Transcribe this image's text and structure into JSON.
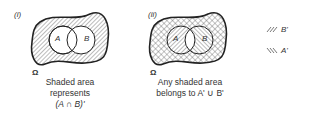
{
  "diagram_i": {
    "label": "(i)",
    "set_a": "A",
    "set_b": "B",
    "universe": "Ω",
    "caption_line1": "Shaded area",
    "caption_line2": "represents",
    "caption_line3": "(A ∩ B)'"
  },
  "diagram_ii": {
    "label": "(ii)",
    "set_a": "A",
    "set_b": "B",
    "universe": "Ω",
    "caption_line1": "Any shaded area",
    "caption_line2": "belongs to A' ∪ B'"
  },
  "legend": [
    {
      "pattern": "////",
      "label": "B'"
    },
    {
      "pattern": "\\\\\\\\",
      "label": "A'"
    }
  ]
}
